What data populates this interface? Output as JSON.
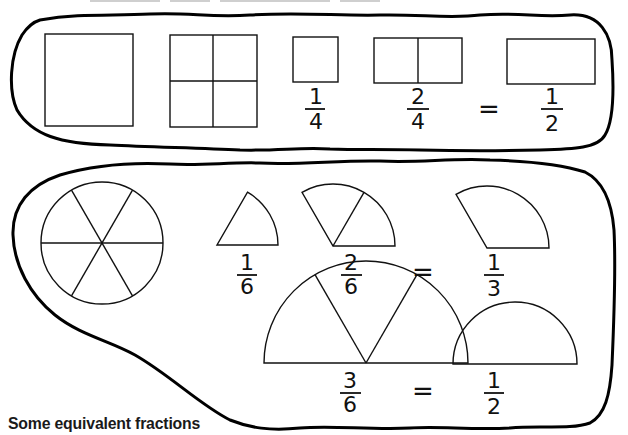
{
  "caption": "Some equivalent fractions",
  "top_panel": {
    "shapes": [
      {
        "name": "whole-square",
        "parts": 1
      },
      {
        "name": "square-quarters",
        "parts": 4
      },
      {
        "name": "one-quarter-square",
        "parts": 1
      },
      {
        "name": "two-quarters-rectangle",
        "parts": 2
      },
      {
        "name": "one-half-rectangle",
        "parts": 1
      }
    ],
    "fractions": [
      {
        "numerator": "1",
        "denominator": "4"
      },
      {
        "numerator": "2",
        "denominator": "4"
      },
      {
        "numerator": "1",
        "denominator": "2"
      }
    ],
    "equals": "="
  },
  "bottom_panel": {
    "shapes": [
      {
        "name": "whole-circle-sixths",
        "parts": 6
      },
      {
        "name": "one-sixth-sector",
        "parts": 1
      },
      {
        "name": "two-sixths-sector",
        "parts": 2
      },
      {
        "name": "one-third-sector",
        "parts": 1
      },
      {
        "name": "three-sixths-semicircle",
        "parts": 3
      },
      {
        "name": "one-half-semicircle",
        "parts": 1
      }
    ],
    "fractions": [
      {
        "numerator": "1",
        "denominator": "6"
      },
      {
        "numerator": "2",
        "denominator": "6"
      },
      {
        "numerator": "1",
        "denominator": "3"
      },
      {
        "numerator": "3",
        "denominator": "6"
      },
      {
        "numerator": "1",
        "denominator": "2"
      }
    ],
    "equals": [
      "=",
      "="
    ]
  }
}
